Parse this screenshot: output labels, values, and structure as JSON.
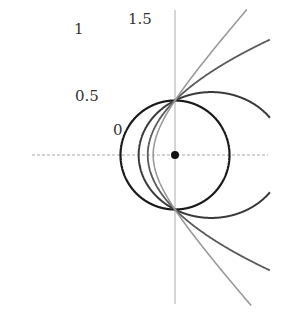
{
  "diagram": {
    "focus": {
      "marker": "focus-dot"
    },
    "curves": [
      {
        "eccentricity": 0,
        "label": "0",
        "kind": "circle",
        "color": "#1a1a1a"
      },
      {
        "eccentricity": 0.5,
        "label": "0.5",
        "kind": "ellipse",
        "color": "#3a3a3a"
      },
      {
        "eccentricity": 1,
        "label": "1",
        "kind": "parabola",
        "color": "#5a5a5a"
      },
      {
        "eccentricity": 1.5,
        "label": "1.5",
        "kind": "hyperbola",
        "color": "#9a9a9a"
      }
    ],
    "axes": {
      "horizontal": {
        "style": "dashed",
        "color": "#aaaaaa"
      },
      "vertical": {
        "style": "solid",
        "color": "#bbbbbb"
      }
    }
  }
}
